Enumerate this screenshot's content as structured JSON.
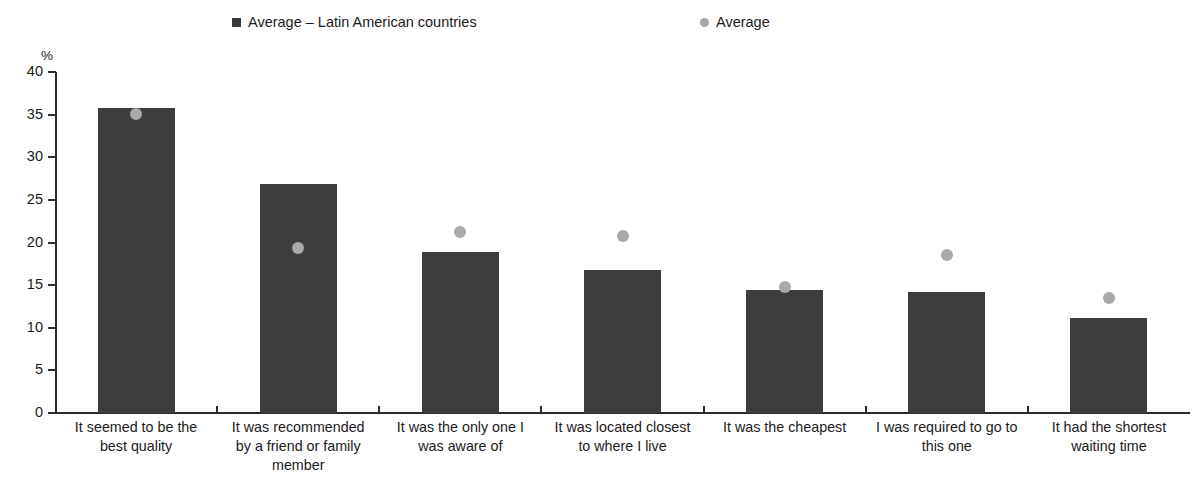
{
  "chart_data": {
    "type": "bar",
    "title": "",
    "subtitle": "",
    "xlabel": "",
    "ylabel": "%",
    "ylim": [
      0,
      40
    ],
    "ytick_step": 5,
    "yticks": [
      "40",
      "35",
      "30",
      "25",
      "20",
      "15",
      "10",
      "5",
      "0"
    ],
    "grid": false,
    "legend_position": "top",
    "categories": [
      "It seemed to be the\nbest quality",
      "It was recommended\nby a friend or family\nmember",
      "It was the only one I\nwas aware of",
      "It was located closest\nto where I live",
      "It was the cheapest",
      "I was required to go to\nthis one",
      "It had the shortest\nwaiting time"
    ],
    "series": [
      {
        "name": "Average – Latin American countries",
        "type": "bar",
        "color": "#3d3d3d",
        "marker": "square",
        "values": [
          35.8,
          26.9,
          18.9,
          16.8,
          14.4,
          14.2,
          11.1
        ]
      },
      {
        "name": "Average",
        "type": "scatter",
        "color": "#a9a9a9",
        "marker": "circle",
        "values": [
          35.1,
          19.3,
          21.2,
          20.8,
          14.8,
          18.5,
          13.5
        ]
      }
    ]
  },
  "legend": {
    "entries": [
      {
        "label": "Average – Latin American countries",
        "marker": "square",
        "color": "#3d3d3d"
      },
      {
        "label": "Average",
        "marker": "circle",
        "color": "#a9a9a9"
      }
    ]
  },
  "axes": {
    "unit_label": "%"
  }
}
